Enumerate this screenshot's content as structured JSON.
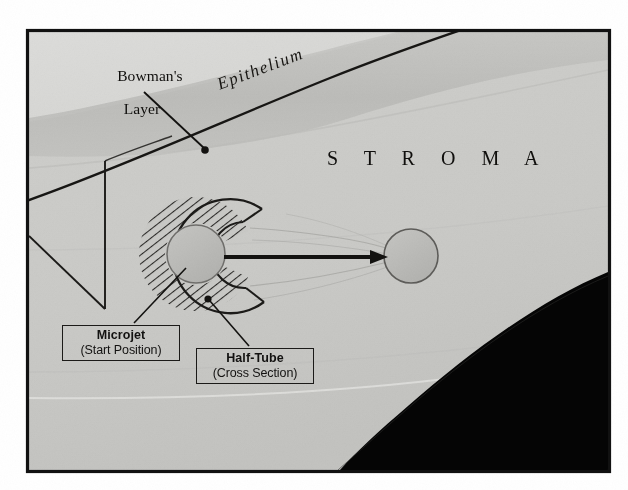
{
  "figure": {
    "kind": "scanned-grayscale-diagram",
    "frame": {
      "border_color": "#111111",
      "background": "#ffffff"
    }
  },
  "labels": {
    "bowmans_line1": "Bowman's",
    "bowmans_line2": "Layer",
    "epithelium": "Epithelium",
    "stroma": "S T R O M A"
  },
  "callouts": [
    {
      "id": "microjet",
      "line1": "Microjet",
      "line2": "(Start Position)"
    },
    {
      "id": "halftube",
      "line1": "Half-Tube",
      "line2": "(Cross Section)"
    }
  ],
  "colors": {
    "ink": "#100f0d",
    "tissue_light": "#d2d2cf",
    "tissue_mid": "#c4c4c1",
    "tissue_dark": "#b4b4b1",
    "epithelium_band": "#b9b9b6",
    "microjet_fill": "#b9b9b6",
    "halftube_fill": "#c9c9c6",
    "shadow_black": "#050505",
    "frame_border": "#111111"
  },
  "geometry": {
    "frame": {
      "x": 27,
      "y": 30,
      "w": 583,
      "h": 442
    },
    "microjet_start_circle": {
      "cx": 196,
      "cy": 254,
      "r": 29
    },
    "microjet_end_circle": {
      "cx": 411,
      "cy": 256,
      "r": 27
    },
    "trajectory_arrow": {
      "x1": 224,
      "y1": 257,
      "x2": 388,
      "y2": 257
    },
    "bowmans_leader": {
      "x1": 142,
      "y1": 92,
      "x2": 205,
      "y2": 150,
      "dot_r": 3.6
    },
    "microjet_leader": {
      "x1": 186,
      "y1": 266,
      "x2": 132,
      "y2": 324
    },
    "halftube_leader": {
      "x1": 208,
      "y1": 299,
      "x2": 248,
      "y2": 347,
      "dot_r": 3.4
    },
    "flap_cut_vertical": {
      "x": 105,
      "y1": 161,
      "y2": 309
    },
    "flap_cut_diagonal": {
      "x1": 27,
      "y1": 236,
      "x2": 105,
      "y2": 309
    }
  }
}
